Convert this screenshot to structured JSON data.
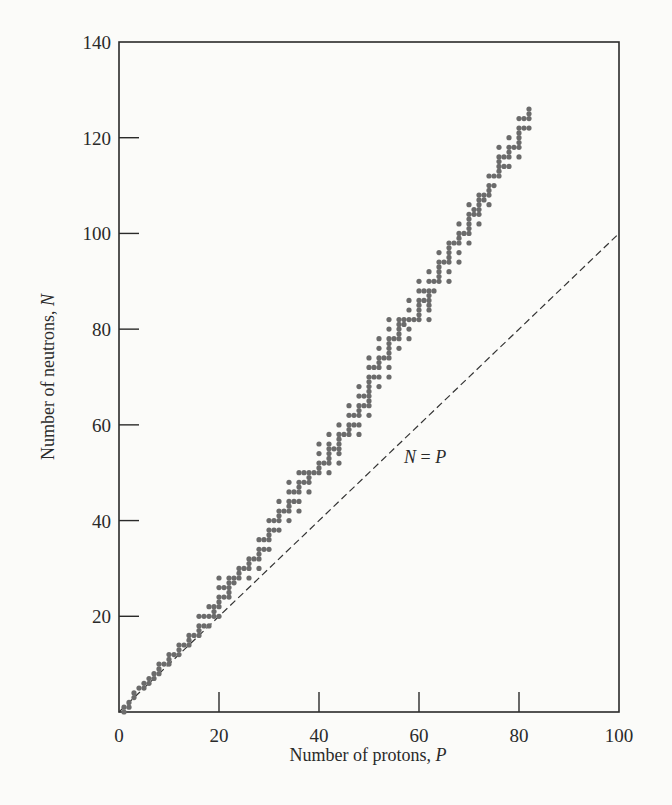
{
  "chart_data": {
    "type": "scatter",
    "title": "",
    "xlabel": "Number of protons, P",
    "ylabel": "Number of neutrons, N",
    "xlim": [
      0,
      100
    ],
    "ylim": [
      0,
      140
    ],
    "xticks": [
      0,
      20,
      40,
      60,
      80,
      100
    ],
    "yticks": [
      20,
      40,
      60,
      80,
      100,
      120,
      140
    ],
    "xtick_labels": [
      "0",
      "20",
      "40",
      "60",
      "80",
      "100"
    ],
    "ytick_labels": [
      "20",
      "40",
      "60",
      "80",
      "100",
      "120",
      "140"
    ],
    "grid": false,
    "legend": null,
    "annotations": [
      {
        "text": "N = P",
        "x": 57,
        "y": 52,
        "italic": true
      }
    ],
    "reference_line": {
      "name": "N = P",
      "style": "dashed",
      "x": [
        0,
        100
      ],
      "y": [
        0,
        100
      ]
    },
    "series": [
      {
        "name": "Stable nuclei",
        "color": "#6b6b6b",
        "points": [
          [
            1,
            0
          ],
          [
            1,
            1
          ],
          [
            2,
            1
          ],
          [
            2,
            2
          ],
          [
            3,
            3
          ],
          [
            3,
            4
          ],
          [
            4,
            5
          ],
          [
            5,
            5
          ],
          [
            5,
            6
          ],
          [
            6,
            6
          ],
          [
            6,
            7
          ],
          [
            7,
            7
          ],
          [
            7,
            8
          ],
          [
            8,
            8
          ],
          [
            8,
            9
          ],
          [
            8,
            10
          ],
          [
            9,
            10
          ],
          [
            10,
            10
          ],
          [
            10,
            11
          ],
          [
            10,
            12
          ],
          [
            11,
            12
          ],
          [
            12,
            12
          ],
          [
            12,
            13
          ],
          [
            12,
            14
          ],
          [
            13,
            14
          ],
          [
            14,
            14
          ],
          [
            14,
            15
          ],
          [
            14,
            16
          ],
          [
            15,
            16
          ],
          [
            16,
            16
          ],
          [
            16,
            17
          ],
          [
            16,
            18
          ],
          [
            16,
            20
          ],
          [
            17,
            18
          ],
          [
            17,
            20
          ],
          [
            18,
            18
          ],
          [
            18,
            20
          ],
          [
            18,
            22
          ],
          [
            19,
            20
          ],
          [
            19,
            21
          ],
          [
            19,
            22
          ],
          [
            20,
            20
          ],
          [
            20,
            22
          ],
          [
            20,
            23
          ],
          [
            20,
            24
          ],
          [
            20,
            26
          ],
          [
            20,
            28
          ],
          [
            21,
            24
          ],
          [
            21,
            26
          ],
          [
            22,
            24
          ],
          [
            22,
            25
          ],
          [
            22,
            26
          ],
          [
            22,
            27
          ],
          [
            22,
            28
          ],
          [
            23,
            27
          ],
          [
            23,
            28
          ],
          [
            24,
            28
          ],
          [
            24,
            29
          ],
          [
            24,
            30
          ],
          [
            25,
            30
          ],
          [
            26,
            28
          ],
          [
            26,
            30
          ],
          [
            26,
            31
          ],
          [
            26,
            32
          ],
          [
            27,
            32
          ],
          [
            28,
            30
          ],
          [
            28,
            32
          ],
          [
            28,
            33
          ],
          [
            28,
            34
          ],
          [
            28,
            36
          ],
          [
            29,
            34
          ],
          [
            29,
            36
          ],
          [
            30,
            34
          ],
          [
            30,
            36
          ],
          [
            30,
            37
          ],
          [
            30,
            38
          ],
          [
            30,
            40
          ],
          [
            31,
            38
          ],
          [
            31,
            40
          ],
          [
            32,
            38
          ],
          [
            32,
            40
          ],
          [
            32,
            41
          ],
          [
            32,
            42
          ],
          [
            32,
            44
          ],
          [
            33,
            42
          ],
          [
            34,
            40
          ],
          [
            34,
            42
          ],
          [
            34,
            43
          ],
          [
            34,
            44
          ],
          [
            34,
            46
          ],
          [
            34,
            48
          ],
          [
            35,
            44
          ],
          [
            35,
            46
          ],
          [
            36,
            42
          ],
          [
            36,
            44
          ],
          [
            36,
            46
          ],
          [
            36,
            47
          ],
          [
            36,
            48
          ],
          [
            36,
            50
          ],
          [
            37,
            48
          ],
          [
            37,
            50
          ],
          [
            38,
            46
          ],
          [
            38,
            48
          ],
          [
            38,
            49
          ],
          [
            38,
            50
          ],
          [
            39,
            50
          ],
          [
            40,
            50
          ],
          [
            40,
            51
          ],
          [
            40,
            52
          ],
          [
            40,
            54
          ],
          [
            40,
            56
          ],
          [
            41,
            52
          ],
          [
            42,
            50
          ],
          [
            42,
            52
          ],
          [
            42,
            53
          ],
          [
            42,
            54
          ],
          [
            42,
            55
          ],
          [
            42,
            56
          ],
          [
            42,
            58
          ],
          [
            43,
            55
          ],
          [
            44,
            52
          ],
          [
            44,
            54
          ],
          [
            44,
            55
          ],
          [
            44,
            56
          ],
          [
            44,
            57
          ],
          [
            44,
            58
          ],
          [
            44,
            60
          ],
          [
            45,
            58
          ],
          [
            46,
            58
          ],
          [
            46,
            59
          ],
          [
            46,
            60
          ],
          [
            46,
            62
          ],
          [
            46,
            64
          ],
          [
            47,
            60
          ],
          [
            47,
            62
          ],
          [
            48,
            58
          ],
          [
            48,
            60
          ],
          [
            48,
            62
          ],
          [
            48,
            63
          ],
          [
            48,
            64
          ],
          [
            48,
            66
          ],
          [
            48,
            68
          ],
          [
            49,
            64
          ],
          [
            49,
            66
          ],
          [
            50,
            62
          ],
          [
            50,
            64
          ],
          [
            50,
            65
          ],
          [
            50,
            66
          ],
          [
            50,
            67
          ],
          [
            50,
            68
          ],
          [
            50,
            69
          ],
          [
            50,
            70
          ],
          [
            50,
            72
          ],
          [
            50,
            74
          ],
          [
            51,
            70
          ],
          [
            51,
            72
          ],
          [
            52,
            68
          ],
          [
            52,
            70
          ],
          [
            52,
            72
          ],
          [
            52,
            73
          ],
          [
            52,
            74
          ],
          [
            52,
            76
          ],
          [
            52,
            78
          ],
          [
            53,
            74
          ],
          [
            54,
            70
          ],
          [
            54,
            72
          ],
          [
            54,
            74
          ],
          [
            54,
            75
          ],
          [
            54,
            76
          ],
          [
            54,
            77
          ],
          [
            54,
            78
          ],
          [
            54,
            80
          ],
          [
            54,
            82
          ],
          [
            55,
            78
          ],
          [
            56,
            76
          ],
          [
            56,
            78
          ],
          [
            56,
            79
          ],
          [
            56,
            80
          ],
          [
            56,
            81
          ],
          [
            56,
            82
          ],
          [
            57,
            81
          ],
          [
            57,
            82
          ],
          [
            58,
            78
          ],
          [
            58,
            80
          ],
          [
            58,
            82
          ],
          [
            58,
            84
          ],
          [
            58,
            86
          ],
          [
            59,
            82
          ],
          [
            60,
            82
          ],
          [
            60,
            83
          ],
          [
            60,
            84
          ],
          [
            60,
            85
          ],
          [
            60,
            86
          ],
          [
            60,
            88
          ],
          [
            60,
            90
          ],
          [
            61,
            86
          ],
          [
            61,
            88
          ],
          [
            62,
            82
          ],
          [
            62,
            84
          ],
          [
            62,
            85
          ],
          [
            62,
            86
          ],
          [
            62,
            87
          ],
          [
            62,
            88
          ],
          [
            62,
            90
          ],
          [
            62,
            92
          ],
          [
            63,
            88
          ],
          [
            63,
            90
          ],
          [
            64,
            90
          ],
          [
            64,
            91
          ],
          [
            64,
            92
          ],
          [
            64,
            93
          ],
          [
            64,
            94
          ],
          [
            64,
            96
          ],
          [
            65,
            94
          ],
          [
            66,
            90
          ],
          [
            66,
            92
          ],
          [
            66,
            94
          ],
          [
            66,
            95
          ],
          [
            66,
            96
          ],
          [
            66,
            97
          ],
          [
            66,
            98
          ],
          [
            67,
            98
          ],
          [
            68,
            94
          ],
          [
            68,
            96
          ],
          [
            68,
            98
          ],
          [
            68,
            99
          ],
          [
            68,
            100
          ],
          [
            68,
            102
          ],
          [
            69,
            100
          ],
          [
            70,
            98
          ],
          [
            70,
            100
          ],
          [
            70,
            101
          ],
          [
            70,
            102
          ],
          [
            70,
            103
          ],
          [
            70,
            104
          ],
          [
            70,
            106
          ],
          [
            71,
            104
          ],
          [
            71,
            105
          ],
          [
            72,
            102
          ],
          [
            72,
            104
          ],
          [
            72,
            105
          ],
          [
            72,
            106
          ],
          [
            72,
            107
          ],
          [
            72,
            108
          ],
          [
            73,
            107
          ],
          [
            73,
            108
          ],
          [
            74,
            106
          ],
          [
            74,
            108
          ],
          [
            74,
            109
          ],
          [
            74,
            110
          ],
          [
            74,
            112
          ],
          [
            75,
            110
          ],
          [
            75,
            112
          ],
          [
            76,
            112
          ],
          [
            76,
            113
          ],
          [
            76,
            114
          ],
          [
            76,
            115
          ],
          [
            76,
            116
          ],
          [
            76,
            118
          ],
          [
            77,
            114
          ],
          [
            77,
            116
          ],
          [
            78,
            114
          ],
          [
            78,
            116
          ],
          [
            78,
            117
          ],
          [
            78,
            118
          ],
          [
            78,
            120
          ],
          [
            79,
            118
          ],
          [
            80,
            116
          ],
          [
            80,
            118
          ],
          [
            80,
            119
          ],
          [
            80,
            120
          ],
          [
            80,
            121
          ],
          [
            80,
            122
          ],
          [
            80,
            124
          ],
          [
            81,
            122
          ],
          [
            81,
            124
          ],
          [
            82,
            122
          ],
          [
            82,
            124
          ],
          [
            82,
            125
          ],
          [
            82,
            126
          ]
        ]
      }
    ]
  }
}
